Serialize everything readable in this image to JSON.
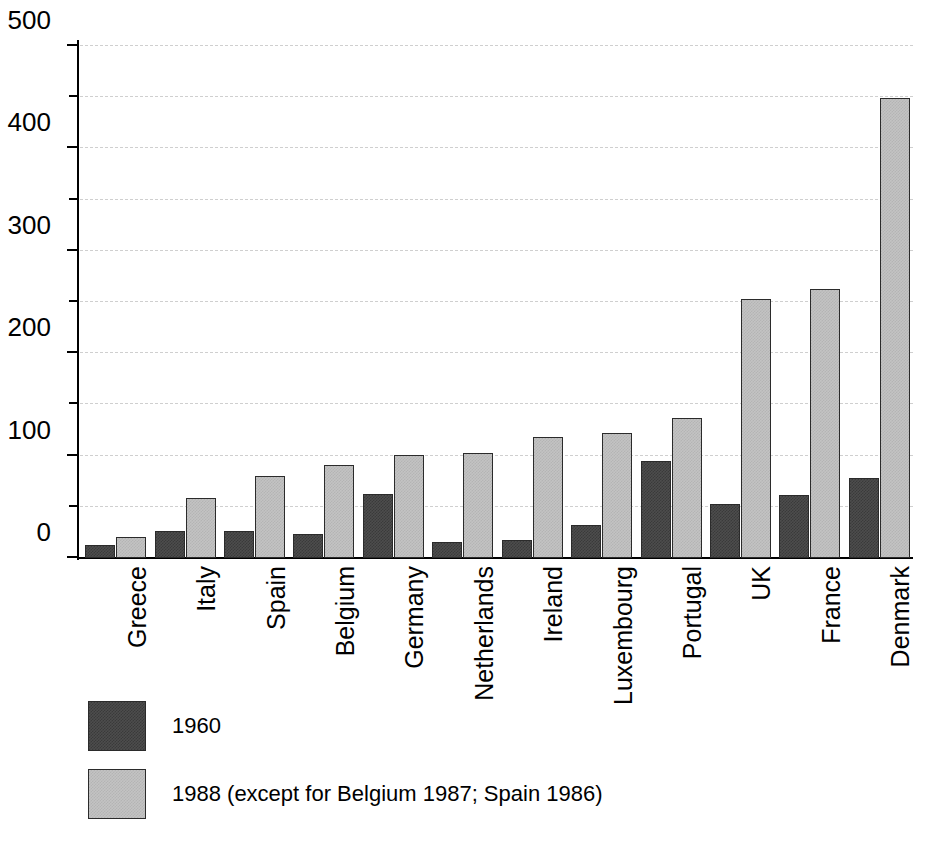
{
  "chart_data": {
    "type": "bar",
    "title": "",
    "subtitle": "",
    "xlabel": "",
    "ylabel": "",
    "ylim": [
      0,
      500
    ],
    "ytick_labels": [
      "0",
      "100",
      "200",
      "300",
      "400",
      "500"
    ],
    "ytick_values": [
      0,
      100,
      200,
      300,
      400,
      500
    ],
    "yminor_values": [
      50,
      150,
      250,
      350,
      450
    ],
    "gridlines": [
      50,
      100,
      150,
      200,
      250,
      300,
      350,
      400,
      450,
      500
    ],
    "grid": true,
    "grid_style": "dashed",
    "legend_position": "below-plot",
    "categories": [
      "Greece",
      "Italy",
      "Spain",
      "Belgium",
      "Germany",
      "Netherlands",
      "Ireland",
      "Luxembourg",
      "Portugal",
      "UK",
      "France",
      "Denmark"
    ],
    "series": [
      {
        "name": "1960",
        "label": "1960",
        "color": "#4d4d4d",
        "values": [
          13,
          26,
          26,
          23,
          63,
          16,
          18,
          32,
          95,
          53,
          62,
          78
        ]
      },
      {
        "name": "1988",
        "label": "1988 (except for Belgium 1987; Spain 1986)",
        "color": "#c3c3c3",
        "values": [
          21,
          59,
          80,
          91,
          101,
          103,
          118,
          122,
          137,
          253,
          263,
          449
        ]
      }
    ]
  },
  "legend": {
    "items": [
      {
        "label": "1960",
        "swatch": "dark-gray-hatch"
      },
      {
        "label": "1988 (except for Belgium 1987; Spain 1986)",
        "swatch": "light-gray-hatch"
      }
    ]
  },
  "axis": {
    "y_label_0": "0",
    "y_label_100": "100",
    "y_label_200": "200",
    "y_label_300": "300",
    "y_label_400": "400",
    "y_label_500": "500"
  }
}
